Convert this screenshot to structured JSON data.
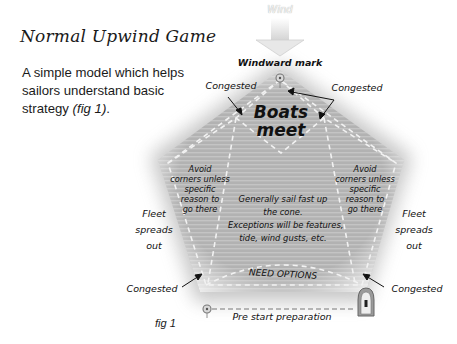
{
  "title": "Normal Upwind Game",
  "intro": {
    "text": "A simple model which helps sailors understand basic strategy ",
    "fig_ref": "(fig 1)",
    "end": "."
  },
  "figure": {
    "caption": "fig 1",
    "wind_label": "Wind",
    "windward_mark": "Windward mark",
    "boats_meet": "Boats meet",
    "congested_top_left": "Congested",
    "congested_top_right": "Congested",
    "congested_bottom_left": "Congested",
    "congested_bottom_right": "Congested",
    "avoid_left": [
      "Avoid",
      "corners unless",
      "specific",
      "reason to",
      "go there"
    ],
    "avoid_right": [
      "Avoid",
      "corners unless",
      "specific",
      "reason to",
      "go there"
    ],
    "fleet_left": [
      "Fleet",
      "spreads",
      "out"
    ],
    "fleet_right": [
      "Fleet",
      "spreads",
      "out"
    ],
    "center": [
      "Generally sail fast up",
      "the cone.",
      "Exceptions will be features,",
      "tide, wind gusts, etc."
    ],
    "need_options": "NEED OPTIONS",
    "pre_start": "Pre start preparation",
    "colors": {
      "fill": "#b4b4b4",
      "stripe": "#c2c2c2",
      "dash": "#f2f2f2",
      "text": "#111111"
    }
  }
}
